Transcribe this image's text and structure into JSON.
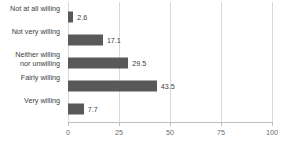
{
  "chart_data": {
    "type": "bar",
    "orientation": "horizontal",
    "title": "",
    "xlabel": "",
    "ylabel": "",
    "categories": [
      "Not at all willing",
      "Not very willing",
      "Neither willing\nnor unwilling",
      "Fairly willing",
      "Very willing"
    ],
    "values": [
      2.6,
      17.1,
      29.5,
      43.5,
      7.7
    ],
    "value_labels": [
      "2.6",
      "17.1",
      "29.5",
      "43.5",
      "7.7"
    ],
    "xlim": [
      0,
      100
    ],
    "xticks": [
      0,
      25,
      50,
      75,
      100
    ],
    "xtick_labels": [
      "0",
      "25",
      "50",
      "75",
      "100"
    ],
    "grid": "vertical",
    "legend": "none",
    "bar_color": "#595959",
    "gridline_color": "#d9d9d9",
    "axis_color": "#bfbfbf",
    "text_color": "#3d3d3d",
    "tick_text_color": "#6b6b6b"
  }
}
